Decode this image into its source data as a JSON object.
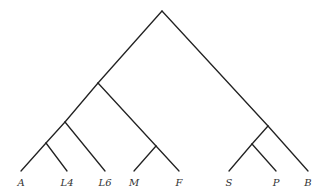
{
  "diagram": {
    "type": "tree",
    "colors": {
      "edge": "#222222",
      "label": "#333333",
      "background": "#ffffff"
    },
    "leaves": [
      {
        "id": "A",
        "label": "A",
        "x": 21,
        "y": 171
      },
      {
        "id": "L4",
        "label": "L4",
        "x": 67,
        "y": 171
      },
      {
        "id": "L6",
        "label": "L6",
        "x": 105,
        "y": 171
      },
      {
        "id": "M",
        "label": "M",
        "x": 134,
        "y": 171
      },
      {
        "id": "F",
        "label": "F",
        "x": 179,
        "y": 171
      },
      {
        "id": "S",
        "label": "S",
        "x": 229,
        "y": 171
      },
      {
        "id": "P",
        "label": "P",
        "x": 276,
        "y": 171
      },
      {
        "id": "B",
        "label": "B",
        "x": 308,
        "y": 171
      }
    ],
    "internal_nodes": [
      {
        "id": "root",
        "x": 162,
        "y": 11
      },
      {
        "id": "n1",
        "x": 98,
        "y": 83
      },
      {
        "id": "n2",
        "x": 65,
        "y": 122
      },
      {
        "id": "n3",
        "x": 46,
        "y": 143
      },
      {
        "id": "n4",
        "x": 156,
        "y": 146
      },
      {
        "id": "n5",
        "x": 268,
        "y": 126
      },
      {
        "id": "n6",
        "x": 252,
        "y": 144
      }
    ],
    "edges": [
      [
        "root",
        "n1"
      ],
      [
        "root",
        "n5"
      ],
      [
        "n1",
        "n2"
      ],
      [
        "n1",
        "n4"
      ],
      [
        "n2",
        "n3"
      ],
      [
        "n2",
        "L6"
      ],
      [
        "n3",
        "A"
      ],
      [
        "n3",
        "L4"
      ],
      [
        "n4",
        "M"
      ],
      [
        "n4",
        "F"
      ],
      [
        "n5",
        "n6"
      ],
      [
        "n5",
        "B"
      ],
      [
        "n6",
        "S"
      ],
      [
        "n6",
        "P"
      ]
    ]
  }
}
